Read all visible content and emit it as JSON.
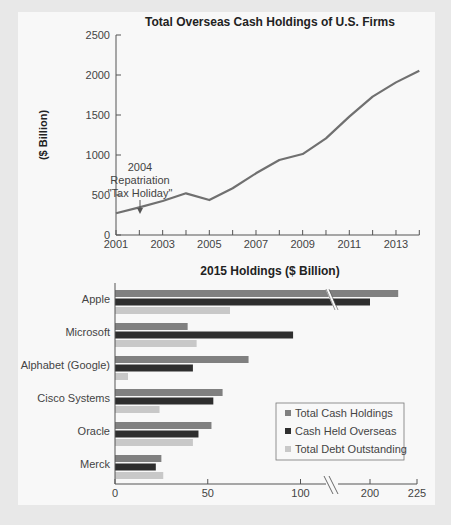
{
  "colors": {
    "line": "#707070",
    "total_cash": "#808080",
    "overseas": "#2e2e2e",
    "debt": "#c8c8c8",
    "axis": "#555555"
  },
  "chart_data": [
    {
      "type": "line",
      "title": "Total Overseas Cash Holdings of U.S. Firms",
      "xlabel": "",
      "ylabel": "($ Billion)",
      "ylim": [
        0,
        2500
      ],
      "yticks": [
        0,
        500,
        1000,
        1500,
        2000,
        2500
      ],
      "xticks_labeled": [
        2001,
        2003,
        2005,
        2007,
        2009,
        2011,
        2013
      ],
      "xlim": [
        2001,
        2014
      ],
      "grid": false,
      "x": [
        2001,
        2002,
        2003,
        2004,
        2005,
        2006,
        2007,
        2008,
        2009,
        2010,
        2011,
        2012,
        2013,
        2014
      ],
      "series": [
        {
          "name": "Total Overseas Cash Holdings",
          "values": [
            272,
            346,
            425,
            521,
            437,
            584,
            771,
            937,
            1012,
            1208,
            1479,
            1729,
            1908,
            2054
          ]
        }
      ],
      "annotations": [
        {
          "text_lines": [
            "2004",
            "Repatriation",
            "\"Tax Holiday\""
          ],
          "x": 2004.7,
          "arrow_to_y": 560
        }
      ]
    },
    {
      "type": "bar",
      "orientation": "horizontal",
      "title": "2015 Holdings ($ Billion)",
      "categories": [
        "Apple",
        "Microsoft",
        "Alphabet (Google)",
        "Cisco Systems",
        "Oracle",
        "Merck"
      ],
      "series": [
        {
          "name": "Total Cash Holdings",
          "values": [
            215,
            103,
            72,
            58,
            52,
            25
          ]
        },
        {
          "name": "Cash Held Overseas",
          "values": [
            200,
            96,
            42,
            53,
            45,
            22
          ]
        },
        {
          "name": "Total Debt Outstanding",
          "values": [
            62,
            44,
            7,
            24,
            42,
            26
          ]
        }
      ],
      "xticks": [
        0,
        50,
        100,
        200,
        225
      ],
      "axis_break": {
        "between": [
          100,
          200
        ],
        "note": "axis break marked with //"
      },
      "xlim": [
        0,
        225
      ],
      "legend_position": "lower right",
      "grid": false
    }
  ]
}
